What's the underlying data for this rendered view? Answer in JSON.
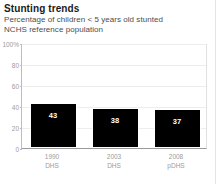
{
  "card": {
    "title": "Stunting trends",
    "subtitle_line1": "Percentage of children < 5 years old stunted",
    "subtitle_line2": "NCHS reference population"
  },
  "colors": {
    "bar": "#000000",
    "bar_label": "#ffffff",
    "axis_text": "#9b9b9b",
    "gridline": "#ededed",
    "title_text": "#1a1a1a",
    "subtitle_text": "#4d4d4d",
    "background": "#ffffff"
  },
  "chart_data": {
    "type": "bar",
    "title": "Stunting trends",
    "subtitle": "Percentage of children < 5 years old stunted NCHS reference population",
    "categories": [
      "1990",
      "2003",
      "2008"
    ],
    "category_sublabels": [
      "DHS",
      "DHS",
      "pDHS"
    ],
    "values": [
      43,
      38,
      37
    ],
    "data_labels": [
      "43",
      "38",
      "37"
    ],
    "xlabel": "",
    "ylabel": "",
    "ylim": [
      0,
      100
    ],
    "yticks": [
      0,
      20,
      40,
      60,
      80,
      100
    ],
    "ytick_labels": [
      "0",
      "20",
      "40",
      "60",
      "80",
      "100%"
    ],
    "grid": true,
    "legend": false,
    "series": [
      {
        "name": "Percentage stunted",
        "values": [
          43,
          38,
          37
        ]
      }
    ]
  }
}
